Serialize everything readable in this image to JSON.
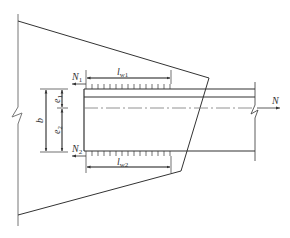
{
  "diagram": {
    "type": "structural-detail",
    "labels": {
      "n1": {
        "main": "N",
        "sub": "1"
      },
      "n2": {
        "main": "N",
        "sub": "2"
      },
      "n": {
        "main": "N"
      },
      "lw1": {
        "main": "l",
        "sub": "w1"
      },
      "lw2": {
        "main": "l",
        "sub": "w2"
      },
      "b": {
        "main": "b"
      },
      "e1": {
        "main": "e",
        "sub": "1"
      },
      "e2": {
        "main": "e",
        "sub": "2"
      }
    },
    "colors": {
      "line": "#333333",
      "thin": "#666666"
    }
  }
}
